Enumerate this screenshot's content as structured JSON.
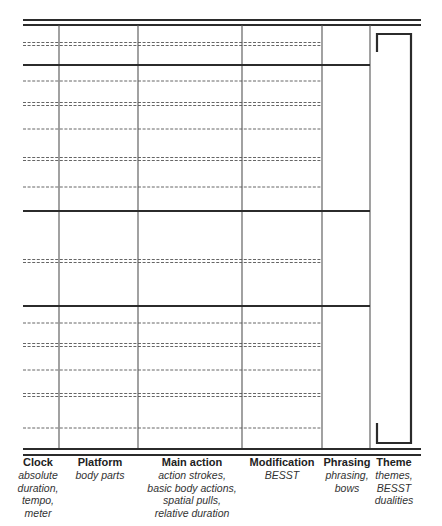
{
  "diagram": {
    "colors": {
      "line": "#2b2b2b",
      "column_line": "#555555",
      "dashed_line": "#555555",
      "background": "#ffffff"
    },
    "frame": {
      "left": 23,
      "right": 421,
      "top_rules": [
        20,
        25
      ],
      "bottom_rules": [
        449,
        455
      ]
    },
    "column_dividers_x": [
      59,
      138,
      242,
      322,
      370
    ],
    "grid_bottom_y": 448,
    "section_dividers_y": [
      65,
      211,
      306
    ],
    "section_divider_right": 370,
    "dashed_right": 322,
    "dashed_lines": [
      {
        "y": 44,
        "kind": "double"
      },
      {
        "y": 81,
        "kind": "single"
      },
      {
        "y": 104,
        "kind": "double"
      },
      {
        "y": 129,
        "kind": "single"
      },
      {
        "y": 159,
        "kind": "double"
      },
      {
        "y": 187,
        "kind": "single"
      },
      {
        "y": 261,
        "kind": "double"
      },
      {
        "y": 323,
        "kind": "single"
      },
      {
        "y": 345,
        "kind": "double"
      },
      {
        "y": 370,
        "kind": "single"
      },
      {
        "y": 395,
        "kind": "double"
      },
      {
        "y": 428,
        "kind": "single"
      }
    ],
    "theme_bracket": {
      "left": 377,
      "right": 411,
      "top": 34,
      "bottom": 443,
      "top_stub_end": 52,
      "bottom_stub_start": 423
    }
  },
  "legend": [
    {
      "id": "clock",
      "x": 38,
      "title": "Clock",
      "lines": [
        "absolute",
        "duration,",
        "tempo,",
        "meter"
      ]
    },
    {
      "id": "platform",
      "x": 100,
      "title": "Platform",
      "lines": [
        "body parts"
      ]
    },
    {
      "id": "main-action",
      "x": 192,
      "title": "Main action",
      "lines": [
        "action strokes,",
        "basic body actions,",
        "spatial pulls,",
        "relative duration"
      ]
    },
    {
      "id": "modification",
      "x": 282,
      "title": "Modification",
      "lines": [
        "BESST"
      ]
    },
    {
      "id": "phrasing",
      "x": 347,
      "title": "Phrasing",
      "lines": [
        "phrasing,",
        "bows"
      ]
    },
    {
      "id": "theme",
      "x": 394,
      "title": "Theme",
      "lines": [
        "themes,",
        "BESST",
        "dualities"
      ]
    }
  ]
}
